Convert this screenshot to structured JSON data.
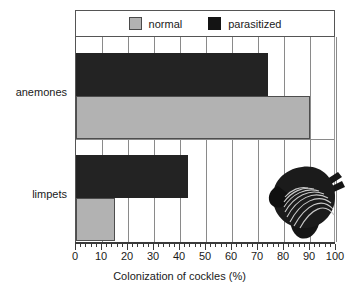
{
  "chart_data": {
    "type": "bar",
    "orientation": "horizontal",
    "title": "",
    "xlabel": "Colonization of cockles (%)",
    "ylabel": "",
    "xlim": [
      0,
      100
    ],
    "xticks": [
      0,
      10,
      20,
      30,
      40,
      50,
      60,
      70,
      80,
      90,
      100
    ],
    "minor_tick_interval": 2,
    "grid": "vertical",
    "legend_position": "top",
    "categories": [
      "anemones",
      "limpets"
    ],
    "series": [
      {
        "name": "normal",
        "color": "#b2b2b2",
        "values": [
          90,
          15
        ]
      },
      {
        "name": "parasitized",
        "color": "#232323",
        "values": [
          74,
          43
        ]
      }
    ],
    "annotations": [
      "cockle-shell-illustration"
    ]
  },
  "legend": {
    "entries": [
      {
        "label": "normal",
        "swatch": "normal-swatch"
      },
      {
        "label": "parasitized",
        "swatch": "parasitized-swatch"
      }
    ]
  },
  "axis": {
    "x_title": "Colonization of cockles (%)",
    "tick_labels": [
      "0",
      "10",
      "20",
      "30",
      "40",
      "50",
      "60",
      "70",
      "80",
      "90",
      "100"
    ]
  },
  "categories": [
    {
      "label": "anemones"
    },
    {
      "label": "limpets"
    }
  ],
  "colors": {
    "normal": "#b2b2b2",
    "parasitized": "#232323",
    "grid": "#8a8a8a",
    "axis": "#3a3a3a",
    "background": "#ffffff"
  }
}
